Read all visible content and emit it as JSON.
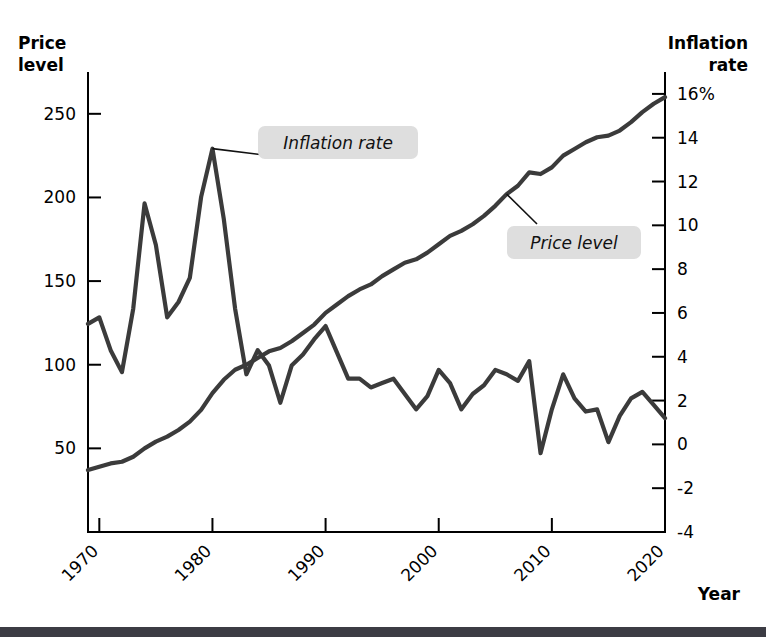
{
  "figure": {
    "background": "#ffffff",
    "line_color": "#3b3b3b",
    "axis_color": "#000000",
    "callout_bg": "#dedede",
    "bottom_bar_color": "#3c3c44"
  },
  "labels": {
    "left_axis_title_line1": "Price",
    "left_axis_title_line2": "level",
    "right_axis_title_line1": "Inflation",
    "right_axis_title_line2": "rate",
    "x_axis_title": "Year",
    "callout_inflation": "Inflation rate",
    "callout_price": "Price level"
  },
  "chart_data": {
    "type": "line",
    "title": "",
    "xlabel": "Year",
    "grid": false,
    "legend": "annotations",
    "x": [
      1969,
      1970,
      1971,
      1972,
      1973,
      1974,
      1975,
      1976,
      1977,
      1978,
      1979,
      1980,
      1981,
      1982,
      1983,
      1984,
      1985,
      1986,
      1987,
      1988,
      1989,
      1990,
      1991,
      1992,
      1993,
      1994,
      1995,
      1996,
      1997,
      1998,
      1999,
      2000,
      2001,
      2002,
      2003,
      2004,
      2005,
      2006,
      2007,
      2008,
      2009,
      2010,
      2011,
      2012,
      2013,
      2014,
      2015,
      2016,
      2017,
      2018,
      2019,
      2020
    ],
    "xlim": [
      1969,
      2020
    ],
    "xticks": [
      1970,
      1980,
      1990,
      2000,
      2010,
      2020
    ],
    "xticklabels": [
      "1970",
      "1980",
      "1990",
      "2000",
      "2010",
      "2020"
    ],
    "series": [
      {
        "name": "Price level",
        "axis": "left",
        "ylabel": "Price level",
        "ylim": [
          0,
          275
        ],
        "yticks": [
          50,
          100,
          150,
          200,
          250
        ],
        "yticklabels": [
          "50",
          "100",
          "150",
          "200",
          "250"
        ],
        "values": [
          37,
          39,
          41,
          42,
          45,
          50,
          54,
          57,
          61,
          66,
          73,
          83,
          91,
          97,
          100,
          104,
          108,
          110,
          114,
          119,
          124,
          131,
          136,
          141,
          145,
          148,
          153,
          157,
          161,
          163,
          167,
          172,
          177,
          180,
          184,
          189,
          195,
          202,
          207,
          215,
          214,
          218,
          225,
          229,
          233,
          236,
          237,
          240,
          245,
          251,
          256,
          260
        ]
      },
      {
        "name": "Inflation rate",
        "axis": "right",
        "ylabel": "Inflation rate",
        "ylim": [
          -4,
          17
        ],
        "yticks": [
          -4,
          -2,
          0,
          2,
          4,
          6,
          8,
          10,
          12,
          14,
          16
        ],
        "yticklabels": [
          "-4",
          "-2",
          "0",
          "2",
          "4",
          "6",
          "8",
          "10",
          "12",
          "14",
          "16%"
        ],
        "values": [
          5.5,
          5.8,
          4.3,
          3.3,
          6.2,
          11.0,
          9.1,
          5.8,
          6.5,
          7.6,
          11.3,
          13.5,
          10.3,
          6.2,
          3.2,
          4.3,
          3.6,
          1.9,
          3.6,
          4.1,
          4.8,
          5.4,
          4.2,
          3.0,
          3.0,
          2.6,
          2.8,
          3.0,
          2.3,
          1.6,
          2.2,
          3.4,
          2.8,
          1.6,
          2.3,
          2.7,
          3.4,
          3.2,
          2.9,
          3.8,
          -0.4,
          1.6,
          3.2,
          2.1,
          1.5,
          1.6,
          0.1,
          1.3,
          2.1,
          2.4,
          1.8,
          1.2
        ]
      }
    ],
    "annotations": [
      {
        "text": "Inflation rate",
        "points_to_year": 1980,
        "points_to_value": 13.5,
        "series": "Inflation rate"
      },
      {
        "text": "Price level",
        "points_to_year": 2006,
        "points_to_value": 202,
        "series": "Price level"
      }
    ]
  }
}
